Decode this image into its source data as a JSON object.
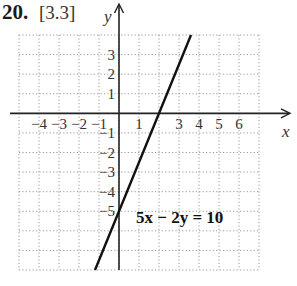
{
  "header": {
    "number": "20.",
    "section": "[3.3]"
  },
  "chart_data": {
    "type": "line",
    "title": "",
    "xlabel": "x",
    "ylabel": "y",
    "xlim": [
      -5,
      7
    ],
    "ylim": [
      -8,
      4
    ],
    "grid": true,
    "grid_style": "dotted",
    "x_ticks": [
      "-4",
      "-3",
      "-2",
      "-1",
      "1",
      "3",
      "4",
      "5",
      "6"
    ],
    "y_ticks": [
      "3",
      "2",
      "1",
      "-1",
      "-2",
      "-3",
      "-4",
      "-5"
    ],
    "series": [
      {
        "name": "5x - 2y = 10",
        "equation": "5x − 2y = 10",
        "slope": 2.5,
        "y_intercept": -5,
        "x_intercept": 2,
        "x": [
          -1.2,
          0,
          2,
          3.6
        ],
        "y": [
          -8,
          -5,
          0,
          4
        ]
      }
    ],
    "annotations": [
      {
        "text": "5x − 2y = 10",
        "x": 1.0,
        "y": -5.6
      }
    ]
  },
  "labels": {
    "equation": "5x − 2y = 10",
    "x_axis": "x",
    "y_axis": "y"
  }
}
